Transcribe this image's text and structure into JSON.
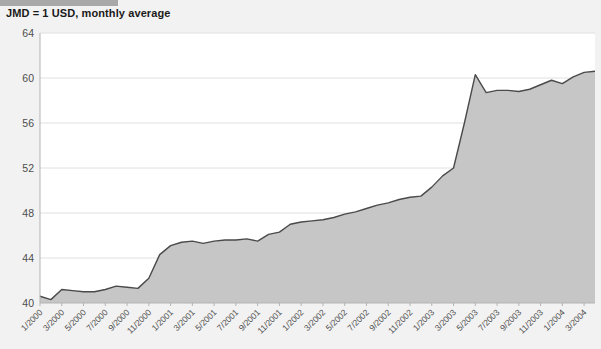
{
  "header": {
    "accent_bar_color": "#a8a8a8",
    "title": "JMD = 1 USD, monthly average"
  },
  "chart_data": {
    "type": "area",
    "title": "JMD = 1 USD, monthly average",
    "xlabel": "",
    "ylabel": "",
    "ylim": [
      40,
      64
    ],
    "yticks": [
      40,
      44,
      48,
      52,
      56,
      60,
      64
    ],
    "grid": true,
    "legend": "none",
    "area_fill_color": "#c6c6c6",
    "line_color": "#4a4a4a",
    "background_color": "#f2f2f2",
    "plot_background_color": "#ffffff",
    "x": [
      "1/2000",
      "2/2000",
      "3/2000",
      "4/2000",
      "5/2000",
      "6/2000",
      "7/2000",
      "8/2000",
      "9/2000",
      "10/2000",
      "11/2000",
      "12/2000",
      "1/2001",
      "2/2001",
      "3/2001",
      "4/2001",
      "5/2001",
      "6/2001",
      "7/2001",
      "8/2001",
      "9/2001",
      "10/2001",
      "11/2001",
      "12/2001",
      "1/2002",
      "2/2002",
      "3/2002",
      "4/2002",
      "5/2002",
      "6/2002",
      "7/2002",
      "8/2002",
      "9/2002",
      "10/2002",
      "11/2002",
      "12/2002",
      "1/2003",
      "2/2003",
      "3/2003",
      "4/2003",
      "5/2003",
      "6/2003",
      "7/2003",
      "8/2003",
      "9/2003",
      "10/2003",
      "11/2003",
      "12/2003",
      "1/2004",
      "2/2004",
      "3/2004",
      "4/2004"
    ],
    "xtick_labels": [
      "1/2000",
      "3/2000",
      "5/2000",
      "7/2000",
      "9/2000",
      "11/2000",
      "1/2001",
      "3/2001",
      "5/2001",
      "7/2001",
      "9/2001",
      "11/2001",
      "1/2002",
      "3/2002",
      "5/2002",
      "7/2002",
      "9/2002",
      "11/2002",
      "1/2003",
      "3/2003",
      "5/2003",
      "7/2003",
      "9/2003",
      "11/2003",
      "1/2004",
      "3/2004"
    ],
    "xtick_every": 2,
    "values": [
      40.6,
      40.3,
      41.2,
      41.1,
      41.0,
      41.0,
      41.2,
      41.5,
      41.4,
      41.3,
      42.2,
      44.3,
      45.1,
      45.4,
      45.5,
      45.3,
      45.5,
      45.6,
      45.6,
      45.7,
      45.5,
      46.1,
      46.3,
      47.0,
      47.2,
      47.3,
      47.4,
      47.6,
      47.9,
      48.1,
      48.4,
      48.7,
      48.9,
      49.2,
      49.4,
      49.5,
      50.3,
      51.3,
      52.0,
      56.0,
      60.3,
      58.7,
      58.9,
      58.9,
      58.8,
      59.0,
      59.4,
      59.8,
      59.5,
      60.1,
      60.5,
      60.6
    ]
  }
}
